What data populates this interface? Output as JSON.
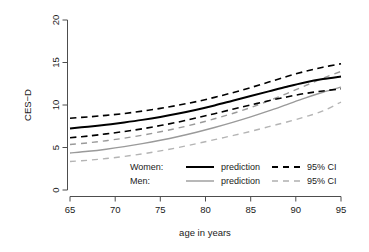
{
  "chart_data": {
    "type": "line",
    "title": "",
    "xlabel": "age in years",
    "ylabel": "CES-D",
    "xlim": [
      63.3,
      96.5
    ],
    "ylim": [
      -0.6,
      21.0
    ],
    "xticks": [
      65,
      70,
      75,
      80,
      85,
      90,
      95
    ],
    "yticks": [
      0,
      5,
      10,
      15,
      20
    ],
    "xtick_labels": [
      "65",
      "70",
      "75",
      "80",
      "85",
      "90",
      "95"
    ],
    "ytick_labels": [
      "0",
      "5",
      "10",
      "15",
      "20"
    ],
    "grid": false,
    "legend_position": "bottom-center",
    "x": [
      65,
      67,
      69,
      71,
      73,
      75,
      77,
      79,
      81,
      83,
      85,
      87,
      89,
      91,
      93,
      95
    ],
    "series": [
      {
        "name": "Women: prediction",
        "group": "Women",
        "role": "prediction",
        "style": "solid",
        "color": "#000000",
        "width": 2.0,
        "values": [
          7.25,
          7.45,
          7.68,
          7.95,
          8.25,
          8.6,
          9.0,
          9.45,
          9.95,
          10.5,
          11.05,
          11.6,
          12.15,
          12.65,
          13.05,
          13.35
        ]
      },
      {
        "name": "Women: 95% CI upper",
        "group": "Women",
        "role": "ci_upper",
        "style": "dashed",
        "color": "#000000",
        "width": 1.6,
        "values": [
          8.45,
          8.6,
          8.78,
          9.0,
          9.28,
          9.6,
          9.98,
          10.4,
          10.9,
          11.45,
          12.05,
          12.7,
          13.35,
          13.95,
          14.45,
          14.85
        ]
      },
      {
        "name": "Women: 95% CI lower",
        "group": "Women",
        "role": "ci_lower",
        "style": "dashed",
        "color": "#000000",
        "width": 1.6,
        "values": [
          6.15,
          6.35,
          6.6,
          6.88,
          7.2,
          7.58,
          8.0,
          8.48,
          8.98,
          9.5,
          10.0,
          10.5,
          10.95,
          11.35,
          11.65,
          11.9
        ]
      },
      {
        "name": "Men: prediction",
        "group": "Men",
        "role": "prediction",
        "style": "solid",
        "color": "#9a9a9a",
        "width": 1.4,
        "values": [
          4.35,
          4.55,
          4.8,
          5.1,
          5.45,
          5.85,
          6.3,
          6.8,
          7.35,
          7.95,
          8.6,
          9.3,
          10.05,
          10.8,
          11.5,
          12.1
        ]
      },
      {
        "name": "Men: 95% CI upper",
        "group": "Men",
        "role": "ci_upper",
        "style": "dashed",
        "color": "#9a9a9a",
        "width": 1.4,
        "values": [
          5.35,
          5.55,
          5.8,
          6.1,
          6.45,
          6.85,
          7.3,
          7.8,
          8.38,
          9.0,
          9.7,
          10.5,
          11.35,
          12.25,
          13.15,
          13.95
        ]
      },
      {
        "name": "Men: 95% CI lower",
        "group": "Men",
        "role": "ci_lower",
        "style": "dashed",
        "color": "#b4b4b4",
        "width": 1.4,
        "values": [
          3.35,
          3.5,
          3.7,
          3.95,
          4.25,
          4.6,
          5.0,
          5.45,
          5.92,
          6.4,
          6.9,
          7.45,
          8.0,
          8.6,
          9.3,
          10.35
        ]
      }
    ],
    "legend": {
      "rows": [
        {
          "group_label": "Women:",
          "prediction_label": "prediction",
          "ci_label": "95% CI",
          "color": "#000000",
          "line_width": 2.0
        },
        {
          "group_label": "Men:",
          "prediction_label": "prediction",
          "ci_label": "95% CI",
          "color": "#9a9a9a",
          "line_width": 1.4
        }
      ]
    }
  },
  "axes": {
    "y_title": "CES−D",
    "x_title": "age in years"
  }
}
